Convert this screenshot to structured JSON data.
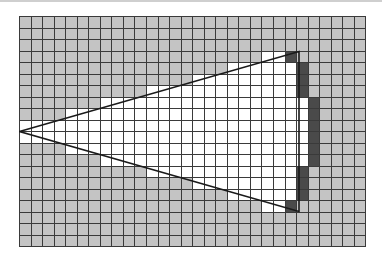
{
  "figure": {
    "grid": {
      "cols": 30,
      "rows": 20
    },
    "colors": {
      "outside": "#c4c4c4",
      "inside": "#ffffff",
      "boundary": "#4a4a4a",
      "gridline": "#3a3a3a",
      "edge": "#1a1a1a"
    },
    "triangle": {
      "vertices": [
        [
          0,
          10
        ],
        [
          24.2,
          3.05
        ],
        [
          24.2,
          16.95
        ]
      ],
      "description": "Triangle with apex at left edge; rasterized cells shown"
    },
    "rows": [
      {
        "row": 3,
        "white": [
          21,
          22
        ],
        "dark": [
          23,
          23
        ]
      },
      {
        "row": 4,
        "white": [
          18,
          23
        ],
        "dark": [
          24,
          24
        ]
      },
      {
        "row": 5,
        "white": [
          15,
          23
        ],
        "dark": [
          24,
          24
        ]
      },
      {
        "row": 6,
        "white": [
          11,
          23
        ],
        "dark": [
          24,
          24
        ]
      },
      {
        "row": 7,
        "white": [
          7,
          24
        ],
        "dark": [
          25,
          25
        ]
      },
      {
        "row": 8,
        "white": [
          4,
          24
        ],
        "dark": [
          25,
          25
        ]
      },
      {
        "row": 9,
        "white": [
          0,
          24
        ],
        "dark": [
          25,
          25
        ]
      },
      {
        "row": 10,
        "white": [
          0,
          24
        ],
        "dark": [
          25,
          25
        ]
      },
      {
        "row": 11,
        "white": [
          4,
          24
        ],
        "dark": [
          25,
          25
        ]
      },
      {
        "row": 12,
        "white": [
          7,
          24
        ],
        "dark": [
          25,
          25
        ]
      },
      {
        "row": 13,
        "white": [
          11,
          23
        ],
        "dark": [
          24,
          24
        ]
      },
      {
        "row": 14,
        "white": [
          15,
          23
        ],
        "dark": [
          24,
          24
        ]
      },
      {
        "row": 15,
        "white": [
          18,
          23
        ],
        "dark": [
          24,
          24
        ]
      },
      {
        "row": 16,
        "white": [
          21,
          22
        ],
        "dark": [
          23,
          23
        ]
      }
    ]
  }
}
